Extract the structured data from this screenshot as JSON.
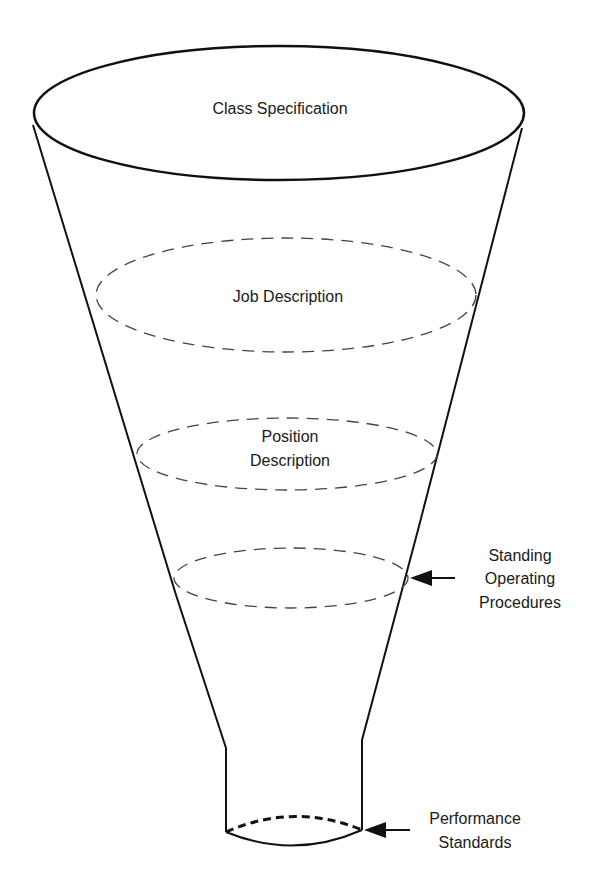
{
  "diagram": {
    "type": "funnel",
    "levels": [
      {
        "label": "Class Specification",
        "style": "solid"
      },
      {
        "label": "Job Description",
        "style": "dashed"
      },
      {
        "label": "Position Description",
        "style": "dashed"
      },
      {
        "label": "Standing Operating Procedures",
        "style": "dashed",
        "callout": true
      },
      {
        "label": "Performance Standards",
        "style": "dashed",
        "callout": true
      }
    ]
  },
  "labels": {
    "class_spec": "Class Specification",
    "job_desc": "Job Description",
    "position_line1": "Position",
    "position_line2": "Description",
    "sop_line1": "Standing",
    "sop_line2": "Operating",
    "sop_line3": "Procedures",
    "perf_line1": "Performance",
    "perf_line2": "Standards"
  }
}
